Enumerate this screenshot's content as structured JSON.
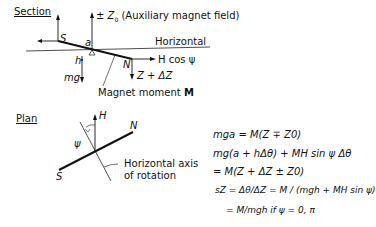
{
  "section": {
    "heading": "Section",
    "z0_label": "± Z",
    "z0_sub": "0",
    "z0_desc": "(Auxiliary magnet field)",
    "horizontal": "Horizontal",
    "s_pole": "S",
    "n_pole": "N",
    "a_label": "a",
    "h_label": "h",
    "mg_label": "mg",
    "hcos_label": "H cos ψ",
    "zdz_label": "Z + ΔZ",
    "moment_label": "Magnet moment",
    "moment_symbol": "M"
  },
  "plan": {
    "heading": "Plan",
    "h_label": "H",
    "n_pole": "N",
    "s_pole": "S",
    "psi_label": "ψ",
    "axis_label_1": "Horizontal axis",
    "axis_label_2": "of rotation"
  },
  "equations": {
    "eq1": "mga = M(Z ∓ Z0)",
    "eq2": "mg(a + hΔθ) + MH sin ψ Δθ",
    "eq3": "= M(Z + ΔZ ± Z0)",
    "eq4_lhs": "sZ = Δθ/ΔZ",
    "eq4_rhs": "= M / (mgh + MH sin ψ)",
    "eq5": "= M/mgh if ψ = 0, π"
  }
}
